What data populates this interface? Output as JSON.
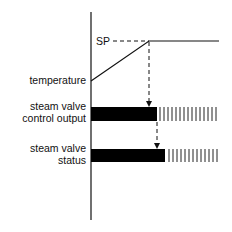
{
  "diagram": {
    "setpoint_label": "SP",
    "labels": {
      "temperature": "temperature",
      "control_output_line1": "steam valve",
      "control_output_line2": "control output",
      "status_line1": "steam valve",
      "status_line2": "status"
    },
    "colors": {
      "line": "#111111",
      "bar": "#000000",
      "background": "#ffffff"
    }
  }
}
